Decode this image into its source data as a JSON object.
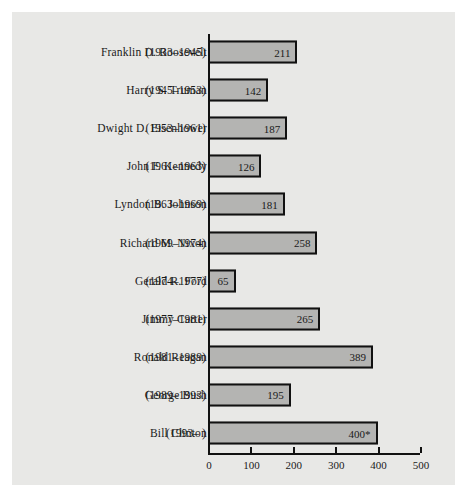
{
  "chart_data": {
    "type": "bar",
    "orientation": "horizontal",
    "title": "",
    "xlabel": "",
    "ylabel": "",
    "xlim": [
      0,
      500
    ],
    "xticks": [
      0,
      100,
      200,
      300,
      400,
      500
    ],
    "grid": false,
    "legend": null,
    "note": "400* indicates an asterisked value for the incumbent president",
    "categories": [
      "Franklin D. Roosevelt",
      "Harry S. Truman",
      "Dwight D. Eisenhower",
      "John F. Kennedy",
      "Lyndon B. Johnson",
      "Richard M. Nixon",
      "Gerald R. Ford",
      "Jimmy Carter",
      "Ronald Reagan",
      "George Bush",
      "Bill Clinton"
    ],
    "values": [
      211,
      142,
      187,
      126,
      181,
      258,
      65,
      265,
      389,
      195,
      400
    ],
    "value_labels": [
      "211",
      "142",
      "187",
      "126",
      "181",
      "258",
      "65",
      "265",
      "389",
      "195",
      "400*"
    ],
    "term_labels": [
      "(1933–1945)",
      "(1945–1953)",
      "(1953–1961)",
      "(1961–1963)",
      "(1963–1969)",
      "(1969–1974)",
      "(1974–1977)",
      "(1977–1981)",
      "(1981–1989)",
      "(1989–1993)",
      "(1993–      )"
    ]
  },
  "style": {
    "panel_background": "#e8e8e6",
    "bar_fill": "#b4b4b2",
    "bar_border": "#111111",
    "text_color": "#1a1a1a"
  }
}
